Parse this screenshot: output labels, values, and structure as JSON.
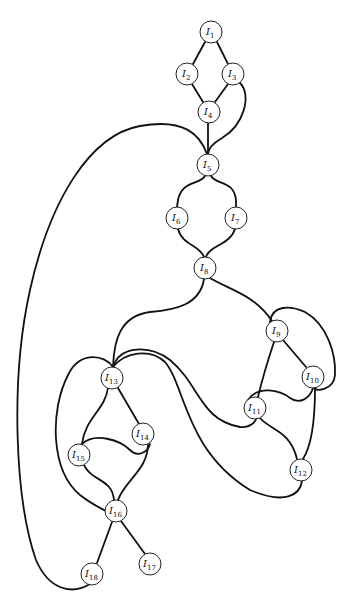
{
  "diagram": {
    "type": "graph",
    "nodes": [
      {
        "id": "I1",
        "letter": "I",
        "sub": "1"
      },
      {
        "id": "I2",
        "letter": "I",
        "sub": "2"
      },
      {
        "id": "I3",
        "letter": "I",
        "sub": "3"
      },
      {
        "id": "I4",
        "letter": "I",
        "sub": "4"
      },
      {
        "id": "I5",
        "letter": "I",
        "sub": "5"
      },
      {
        "id": "I6",
        "letter": "I",
        "sub": "6"
      },
      {
        "id": "I7",
        "letter": "I",
        "sub": "7"
      },
      {
        "id": "I8",
        "letter": "I",
        "sub": "8"
      },
      {
        "id": "I9",
        "letter": "I",
        "sub": "9"
      },
      {
        "id": "I10",
        "letter": "I",
        "sub": "10"
      },
      {
        "id": "I11",
        "letter": "I",
        "sub": "11"
      },
      {
        "id": "I12",
        "letter": "I",
        "sub": "12"
      },
      {
        "id": "I13",
        "letter": "I",
        "sub": "13"
      },
      {
        "id": "I14",
        "letter": "I",
        "sub": "14"
      },
      {
        "id": "I15",
        "letter": "I",
        "sub": "15"
      },
      {
        "id": "I16",
        "letter": "I",
        "sub": "16"
      },
      {
        "id": "I17",
        "letter": "I",
        "sub": "17"
      },
      {
        "id": "I18",
        "letter": "I",
        "sub": "18"
      }
    ],
    "edges": [
      [
        "I1",
        "I2"
      ],
      [
        "I1",
        "I3"
      ],
      [
        "I2",
        "I4"
      ],
      [
        "I3",
        "I4"
      ],
      [
        "I3",
        "I5"
      ],
      [
        "I4",
        "I5"
      ],
      [
        "I18",
        "I5"
      ],
      [
        "I5",
        "I6"
      ],
      [
        "I5",
        "I7"
      ],
      [
        "I6",
        "I8"
      ],
      [
        "I7",
        "I8"
      ],
      [
        "I8",
        "I13"
      ],
      [
        "I8",
        "I9"
      ],
      [
        "I9",
        "I10"
      ],
      [
        "I9",
        "I10"
      ],
      [
        "I9",
        "I11"
      ],
      [
        "I11",
        "I10"
      ],
      [
        "I10",
        "I12"
      ],
      [
        "I11",
        "I12"
      ],
      [
        "I13",
        "I11"
      ],
      [
        "I13",
        "I12"
      ],
      [
        "I13",
        "I14"
      ],
      [
        "I13",
        "I15"
      ],
      [
        "I13",
        "I16"
      ],
      [
        "I15",
        "I14"
      ],
      [
        "I15",
        "I16"
      ],
      [
        "I14",
        "I16"
      ],
      [
        "I16",
        "I17"
      ],
      [
        "I16",
        "I18"
      ]
    ]
  }
}
